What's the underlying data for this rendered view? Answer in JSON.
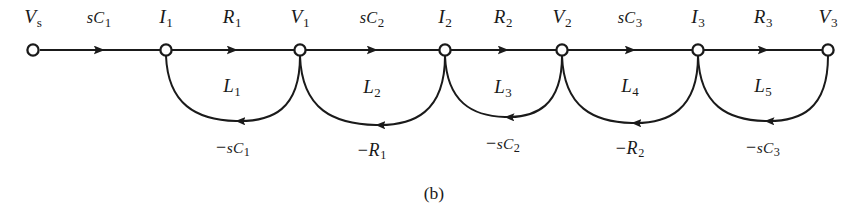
{
  "figure": {
    "caption": "(b)",
    "type": "signal-flow-graph",
    "colors": {
      "background": "#ffffff",
      "ink": "#1a1a1a"
    }
  },
  "nodes": [
    {
      "id": "Vs",
      "base": "V",
      "sub": "s",
      "x": 33,
      "y": 50,
      "label_x": 33,
      "label_y": 18
    },
    {
      "id": "I1",
      "base": "I",
      "sub": "1",
      "x": 166,
      "y": 50,
      "label_x": 166,
      "label_y": 18
    },
    {
      "id": "V1",
      "base": "V",
      "sub": "1",
      "x": 300,
      "y": 50,
      "label_x": 300,
      "label_y": 18
    },
    {
      "id": "I2",
      "base": "I",
      "sub": "2",
      "x": 445,
      "y": 50,
      "label_x": 445,
      "label_y": 18
    },
    {
      "id": "V2",
      "base": "V",
      "sub": "2",
      "x": 562,
      "y": 50,
      "label_x": 562,
      "label_y": 18
    },
    {
      "id": "I3",
      "base": "I",
      "sub": "3",
      "x": 698,
      "y": 50,
      "label_x": 698,
      "label_y": 18
    },
    {
      "id": "V3",
      "base": "V",
      "sub": "3",
      "x": 828,
      "y": 50,
      "label_x": 828,
      "label_y": 18
    }
  ],
  "forward_branches": [
    {
      "from": "Vs",
      "to": "I1",
      "gain_base": "sC",
      "gain_sub": "1",
      "label": "sC1",
      "label_x": 99,
      "label_y": 18
    },
    {
      "from": "I1",
      "to": "V1",
      "gain_base": "R",
      "gain_sub": "1",
      "label": "R1",
      "label_x": 232,
      "label_y": 18
    },
    {
      "from": "V1",
      "to": "I2",
      "gain_base": "sC",
      "gain_sub": "2",
      "label": "sC2",
      "label_x": 372,
      "label_y": 18
    },
    {
      "from": "I2",
      "to": "V2",
      "gain_base": "R",
      "gain_sub": "2",
      "label": "R2",
      "label_x": 503,
      "label_y": 18
    },
    {
      "from": "V2",
      "to": "I3",
      "gain_base": "sC",
      "gain_sub": "3",
      "label": "sC3",
      "label_x": 630,
      "label_y": 18
    },
    {
      "from": "I3",
      "to": "V3",
      "gain_base": "R",
      "gain_sub": "3",
      "label": "R3",
      "label_x": 763,
      "label_y": 18
    }
  ],
  "feedback_branches": [
    {
      "from": "V1",
      "to": "I1",
      "gain_base": "sC",
      "gain_sub": "1",
      "negative": true,
      "label": "-sC1",
      "label_x": 233,
      "label_y": 148
    },
    {
      "from": "I2",
      "to": "V1",
      "gain_base": "R",
      "gain_sub": "1",
      "negative": true,
      "label": "-R1",
      "label_x": 372,
      "label_y": 151
    },
    {
      "from": "V2",
      "to": "I2",
      "gain_base": "sC",
      "gain_sub": "2",
      "negative": true,
      "label": "-sC2",
      "label_x": 503,
      "label_y": 144
    },
    {
      "from": "I3",
      "to": "V2",
      "gain_base": "R",
      "gain_sub": "2",
      "negative": true,
      "label": "-R2",
      "label_x": 630,
      "label_y": 149
    },
    {
      "from": "V3",
      "to": "I3",
      "gain_base": "sC",
      "gain_sub": "3",
      "negative": true,
      "label": "-sC3",
      "label_x": 763,
      "label_y": 148
    }
  ],
  "loops": [
    {
      "id": "L1",
      "base": "L",
      "sub": "1",
      "label_x": 232,
      "label_y": 87
    },
    {
      "id": "L2",
      "base": "L",
      "sub": "2",
      "label_x": 372,
      "label_y": 88
    },
    {
      "id": "L3",
      "base": "L",
      "sub": "3",
      "label_x": 503,
      "label_y": 88
    },
    {
      "id": "L4",
      "base": "L",
      "sub": "4",
      "label_x": 630,
      "label_y": 87
    },
    {
      "id": "L5",
      "base": "L",
      "sub": "5",
      "label_x": 763,
      "label_y": 87
    }
  ],
  "caption": {
    "text": "(b)",
    "x": 434,
    "y": 193
  }
}
